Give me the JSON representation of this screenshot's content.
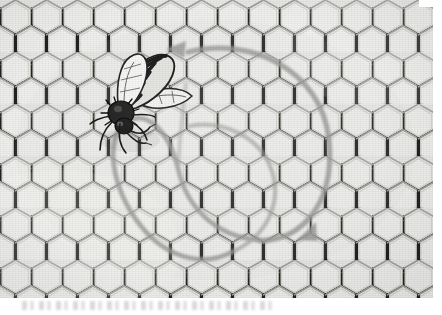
{
  "image": {
    "kind": "scanned-photograph",
    "subject": "honeybee-on-honeycomb",
    "description": "Black and white scanned illustration of a honey bee standing on a sheet of hexagonal honeycomb, with grey drawn arrows tracing a looping figure-eight waggle-dance path over the comb.",
    "palette": {
      "paper": "#ffffff",
      "comb_light": "#eeeeec",
      "comb_midtone": "#c9c9c6",
      "comb_shadow": "#3a3a38",
      "ink_black": "#141414",
      "arrow_grey": "#9a9a9a"
    },
    "photo_frame": {
      "x": 0,
      "y": 0,
      "width": 433,
      "height": 298
    },
    "caption_text": ""
  },
  "comb": {
    "label": "honeycomb-cells",
    "cell_width": 31,
    "cell_height": 34,
    "columns": 16,
    "rows": 11,
    "orientation": "pointy-top-hexagon-grid"
  },
  "bee": {
    "label": "honey-bee",
    "position": {
      "x": 100,
      "y": 52,
      "width": 92,
      "height": 100
    },
    "parts": [
      "head",
      "antennae",
      "thorax",
      "striped-abdomen",
      "forewing",
      "hindwing",
      "legs"
    ],
    "stripe_count": 6
  },
  "annotation": {
    "label": "waggle-dance-path",
    "shape": "figure-eight-double-loop",
    "stroke_color": "#9a9a9a",
    "stroke_width": 5,
    "arrowheads": [
      {
        "id": "arrowhead-upper-left",
        "x": 170,
        "y": 49,
        "direction": "left"
      },
      {
        "id": "arrowhead-lower-right",
        "x": 303,
        "y": 233,
        "direction": "down-left"
      }
    ],
    "loops": [
      {
        "id": "loop-right",
        "cx": 252,
        "cy": 148,
        "rx": 78,
        "ry": 93
      },
      {
        "id": "loop-left",
        "cx": 168,
        "cy": 160,
        "rx": 62,
        "ry": 86
      }
    ]
  }
}
